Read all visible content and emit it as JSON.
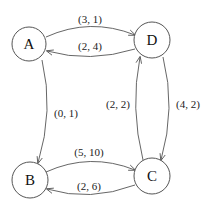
{
  "diagram": {
    "type": "directed-graph",
    "nodes": {
      "A": {
        "label": "A",
        "cx": 29,
        "cy": 44,
        "r": 17
      },
      "D": {
        "label": "D",
        "cx": 152,
        "cy": 40,
        "r": 18
      },
      "B": {
        "label": "B",
        "cx": 30,
        "cy": 180,
        "r": 18
      },
      "C": {
        "label": "C",
        "cx": 152,
        "cy": 176,
        "r": 18
      }
    },
    "edges": {
      "A_to_D": {
        "from": "A",
        "to": "D",
        "label": "(3, 1)"
      },
      "D_to_A": {
        "from": "D",
        "to": "A",
        "label": "(2, 4)"
      },
      "A_to_B": {
        "from": "A",
        "to": "B",
        "label": "(0, 1)"
      },
      "C_to_D": {
        "from": "C",
        "to": "D",
        "label": "(2, 2)"
      },
      "D_to_C": {
        "from": "D",
        "to": "C",
        "label": "(4, 2)"
      },
      "B_to_C": {
        "from": "B",
        "to": "C",
        "label": "(5, 10)"
      },
      "C_to_B": {
        "from": "C",
        "to": "B",
        "label": "(2, 6)"
      }
    },
    "colors": {
      "stroke": "#555555",
      "text": "#111111",
      "background": "#ffffff"
    }
  }
}
